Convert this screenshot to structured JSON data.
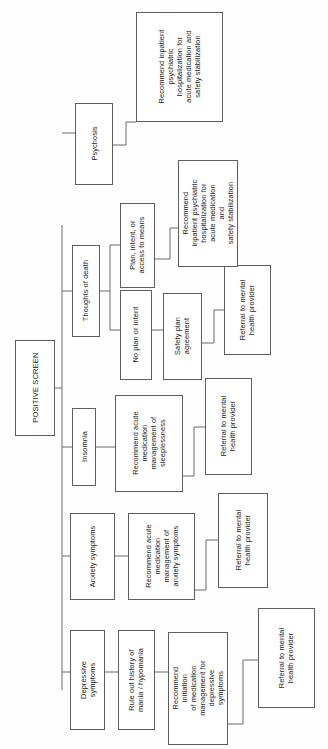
{
  "diagram": {
    "title": "POSITIVE SCREEN",
    "orientation": "rotated-90-ccw",
    "root": {
      "id": "positive-screen",
      "label": "POSITIVE SCREEN"
    },
    "branches": [
      {
        "id": "depressive-symptoms",
        "label": "Depressive\nsymptoms",
        "steps": [
          {
            "id": "rule-out-mania",
            "label": "Rule out history of\nmania / hypomania"
          },
          {
            "id": "recommend-initiation-depressive",
            "label": "Recommend\ninitiation\nof medication\nmanagement for\ndepressive\nsymptoms"
          },
          {
            "id": "referral-depressive",
            "label": "Referral to mental\nhealth provider"
          }
        ]
      },
      {
        "id": "anxiety-symptoms",
        "label": "Anxiety symptoms",
        "steps": [
          {
            "id": "recommend-acute-anxiety",
            "label": "Recommend acute\nmedication\nmanagement of\nanxiety symptoms"
          },
          {
            "id": "referral-anxiety",
            "label": "Referral to mental\nhealth provider"
          }
        ]
      },
      {
        "id": "insomnia",
        "label": "Insomnia",
        "steps": [
          {
            "id": "recommend-acute-sleeplessness",
            "label": "Recommend acute\nmedication\nmanagement of\nsleeplessness"
          },
          {
            "id": "referral-insomnia",
            "label": "Referral to mental\nhealth provider"
          }
        ]
      },
      {
        "id": "thoughts-of-death",
        "label": "Thoughts of death",
        "substeps": [
          {
            "id": "no-plan-or-intent",
            "label": "No plan or intent",
            "steps": [
              {
                "id": "safety-plan-agreement",
                "label": "Safety plan\nagreement"
              },
              {
                "id": "referral-safety-plan",
                "label": "Referral to mental\nhealth provider"
              }
            ]
          },
          {
            "id": "plan-intent-means",
            "label": "Plan, intent, or\naccess to means",
            "steps": [
              {
                "id": "recommend-inpatient-suicidality",
                "label": "Recommend\ninpatient psychiatric\nhospitalization for\nacute medication\nand\nsafety stabilization"
              }
            ]
          }
        ]
      },
      {
        "id": "psychosis",
        "label": "Psychosis",
        "steps": [
          {
            "id": "recommend-inpatient-psychosis",
            "label": "Recommend inpatient\npsychiatric\nhospitalization for\nacute medication and\nsafety stabilization"
          }
        ]
      }
    ]
  }
}
